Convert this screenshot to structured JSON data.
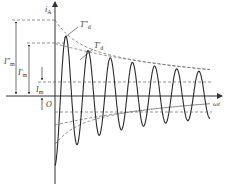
{
  "diagram": {
    "axes": {
      "y_label": "i",
      "y_label_sub": "A",
      "x_label": "ωt",
      "origin_label": "O"
    },
    "envelope_labels": {
      "subtransient": "T″",
      "subtransient_sub": "d",
      "transient": "T′",
      "transient_sub": "d"
    },
    "amplitude_labels": {
      "subtransient": "I″",
      "subtransient_sub": "m",
      "transient": "I′",
      "transient_sub": "m",
      "steady": "I",
      "steady_sub": "m"
    },
    "colors": {
      "curve": "#2a2a2a",
      "axis": "#333333",
      "dashed": "#666666"
    },
    "waveform": {
      "subtransient_amplitude": 1.0,
      "transient_amplitude": 0.69,
      "steady_amplitude": 0.18,
      "cycles_shown": 7
    }
  }
}
